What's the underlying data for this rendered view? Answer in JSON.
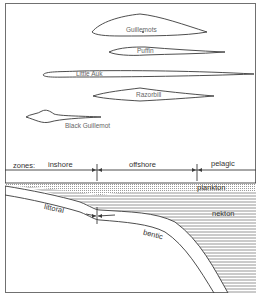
{
  "birds": [
    {
      "name": "Guillemots",
      "has_dot": true
    },
    {
      "name": "Puffin"
    },
    {
      "name": "Little Auk"
    },
    {
      "name": "Razorbill"
    },
    {
      "name": "Black Guillemot"
    }
  ],
  "zones": {
    "prefix": "zones:",
    "items": [
      "inshore",
      "offshore",
      "pelagic"
    ]
  },
  "habitats": {
    "plankton": "plankton",
    "nekton": "nekton",
    "littoral": "littoral",
    "bentic": "bentic"
  },
  "colors": {
    "line": "#3a3a3a",
    "frame": "#707070",
    "hatch": "#9a9a9a",
    "plankton_fill": "#d8d8d8"
  }
}
